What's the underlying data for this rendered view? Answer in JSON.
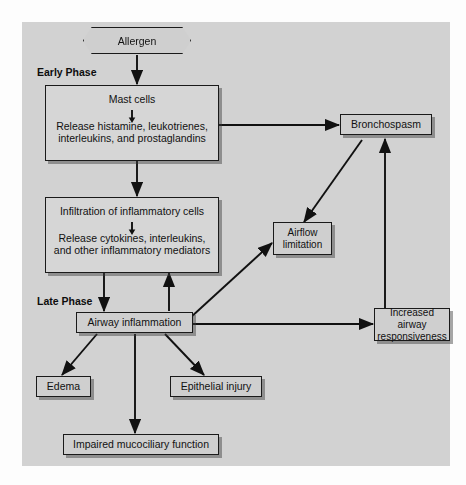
{
  "figure": {
    "type": "flowchart",
    "title_ghost_top": "",
    "caption_ghost_bottom": "",
    "panel_background": "#d2d2d2",
    "node_fill": "#cfcfcf",
    "node_border": "#1a1a1a"
  },
  "phases": [
    {
      "id": "early",
      "label": "Early Phase"
    },
    {
      "id": "late",
      "label": "Late Phase"
    }
  ],
  "nodes": {
    "allergen": {
      "label": "Allergen",
      "shape": "hexagon"
    },
    "mast": {
      "head": "Mast cells",
      "body": "Release histamine, leukotrienes,\ninterleukins, and prostaglandins",
      "body_line1": "Release histamine, leukotrienes,",
      "body_line2": "interleukins, and prostaglandins",
      "shape": "compound-box"
    },
    "infiltration": {
      "head": "Infiltration of inflammatory cells",
      "body": "Release cytokines, interleukins,\nand other inflammatory mediators",
      "body_line1": "Release cytokines, interleukins,",
      "body_line2": "and other inflammatory mediators",
      "shape": "compound-box"
    },
    "airway_inflam": {
      "label": "Airway inflammation",
      "shape": "box"
    },
    "edema": {
      "label": "Edema",
      "shape": "box"
    },
    "epithelial": {
      "label": "Epithelial injury",
      "shape": "box"
    },
    "mucociliary": {
      "label": "Impaired mucociliary function",
      "shape": "box"
    },
    "bronchospasm": {
      "label": "Bronchospasm",
      "shape": "box"
    },
    "airflow": {
      "line1": "Airflow",
      "line2": "limitation",
      "shape": "box"
    },
    "responsiveness": {
      "line1": "Increased airway",
      "line2": "responsiveness",
      "shape": "box"
    }
  },
  "edges": [
    {
      "from": "allergen",
      "to": "mast",
      "style": "straight-down",
      "arrow": "end"
    },
    {
      "from": "mast",
      "to": "infiltration",
      "style": "straight-down",
      "arrow": "end"
    },
    {
      "from": "mast",
      "to": "bronchospasm",
      "style": "horizontal",
      "arrow": "end"
    },
    {
      "from": "infiltration",
      "to": "airway_inflam",
      "style": "straight-down",
      "arrow": "end"
    },
    {
      "from": "airway_inflam",
      "to": "infiltration",
      "style": "straight-up",
      "arrow": "end"
    },
    {
      "from": "airway_inflam",
      "to": "airflow",
      "style": "diagonal",
      "arrow": "end"
    },
    {
      "from": "airway_inflam",
      "to": "responsiveness",
      "style": "horizontal",
      "arrow": "end"
    },
    {
      "from": "airway_inflam",
      "to": "edema",
      "style": "diagonal",
      "arrow": "end"
    },
    {
      "from": "airway_inflam",
      "to": "epithelial",
      "style": "diagonal",
      "arrow": "end"
    },
    {
      "from": "airway_inflam",
      "to": "mucociliary",
      "style": "straight-down",
      "arrow": "end"
    },
    {
      "from": "bronchospasm",
      "to": "airflow",
      "style": "diagonal",
      "arrow": "end"
    },
    {
      "from": "responsiveness",
      "to": "bronchospasm",
      "style": "straight-up",
      "arrow": "end"
    }
  ]
}
